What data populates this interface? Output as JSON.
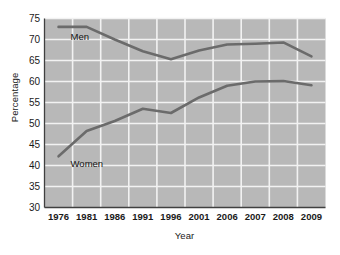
{
  "chart_data": {
    "type": "line",
    "title": "",
    "xlabel": "Year",
    "ylabel": "Percentage",
    "categories": [
      "1976",
      "1981",
      "1986",
      "1991",
      "1996",
      "2001",
      "2006",
      "2007",
      "2008",
      "2009"
    ],
    "ylim": [
      30,
      75
    ],
    "yticks": [
      30,
      35,
      40,
      45,
      50,
      55,
      60,
      65,
      70,
      75
    ],
    "grid": true,
    "legend_position": "inline-labels",
    "series": [
      {
        "name": "Men",
        "color": "#6b6b6b",
        "values": [
          73.0,
          73.0,
          70.0,
          67.2,
          65.3,
          67.4,
          68.8,
          69.0,
          69.3,
          66.0
        ]
      },
      {
        "name": "Women",
        "color": "#6b6b6b",
        "values": [
          42.2,
          48.2,
          50.6,
          53.5,
          52.5,
          56.2,
          59.0,
          60.0,
          60.1,
          59.1
        ]
      }
    ],
    "annotations": [
      {
        "text": "Men",
        "series": "Men"
      },
      {
        "text": "Women",
        "series": "Women"
      }
    ]
  },
  "colors": {
    "plot_background": "#b8b8b8",
    "gridline": "#f2f2f2",
    "axis": "#404040",
    "line": "#6b6b6b",
    "page_background": "#ffffff"
  }
}
